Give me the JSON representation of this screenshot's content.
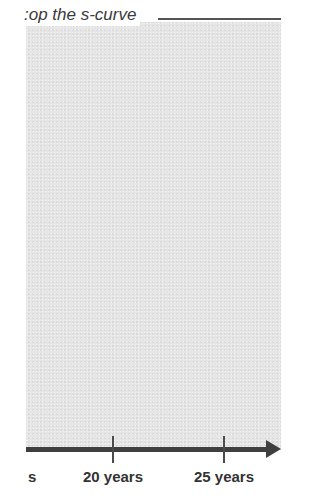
{
  "diagram": {
    "title_visible_fragment": ":op the s-curve",
    "shaded_region_color": "#e6e6e6",
    "axis_color": "#3f3f3f",
    "axis": {
      "direction": "right",
      "ticks": [
        {
          "label": "s",
          "x": 33,
          "has_tick": false
        },
        {
          "label": "20 years",
          "x": 113,
          "has_tick": true
        },
        {
          "label": "25 years",
          "x": 224,
          "has_tick": true
        }
      ]
    }
  }
}
